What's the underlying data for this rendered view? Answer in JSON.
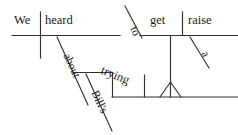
{
  "diagram": {
    "type": "reed-kellogg-sentence-diagram",
    "sentence": "We heard about Bill's trying to get a raise.",
    "stroke_color": "#333333",
    "text_color": "#1a1a1a",
    "background_color": "#ffffff",
    "words": {
      "subject": "We",
      "verb": "heard",
      "preposition": "about",
      "possessive": "Bill's",
      "gerund": "trying",
      "infinitive_marker": "to",
      "infinitive_verb": "get",
      "direct_object": "raise",
      "article": "a"
    },
    "clauses": {
      "main_baseline_label": "We | heard",
      "infinitive_baseline_label": "to get | raise",
      "gerund_phrase_label": "Bill's trying"
    }
  }
}
